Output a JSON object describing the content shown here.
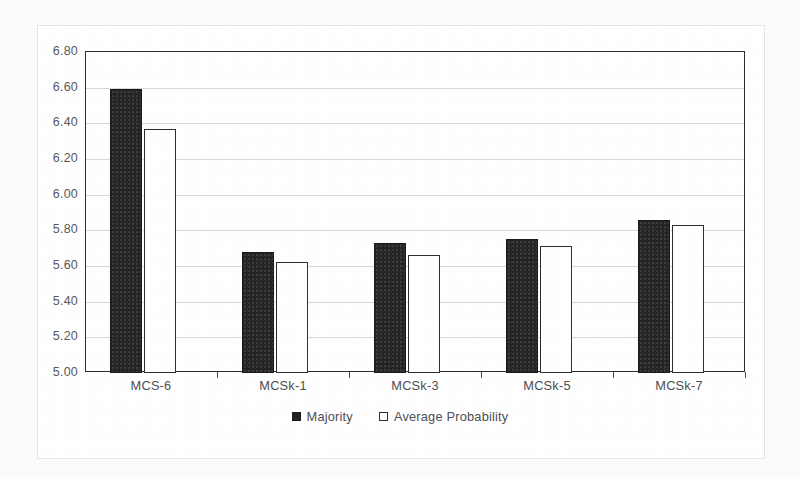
{
  "chart_data": {
    "type": "bar",
    "title": "",
    "subtitle": "",
    "xlabel": "",
    "ylabel": "",
    "categories": [
      "MCS-6",
      "MCSk-1",
      "MCSk-3",
      "MCSk-5",
      "MCSk-7"
    ],
    "series": [
      {
        "name": "Majority",
        "color": "#232323",
        "style": "filled",
        "values": [
          6.59,
          5.68,
          5.73,
          5.75,
          5.86
        ]
      },
      {
        "name": "Average Probability",
        "color": "#ffffff",
        "style": "outlined",
        "values": [
          6.37,
          5.62,
          5.66,
          5.71,
          5.83
        ]
      }
    ],
    "ylim": [
      5.0,
      6.8
    ],
    "ytick_step": 0.2,
    "ytick_labels": [
      "6.80",
      "6.60",
      "6.40",
      "6.20",
      "6.00",
      "5.80",
      "5.60",
      "5.40",
      "5.20",
      "5.00"
    ],
    "ytick_values": [
      6.8,
      6.6,
      6.4,
      6.2,
      6.0,
      5.8,
      5.6,
      5.4,
      5.2,
      5.0
    ],
    "grid": true,
    "grid_axis": "y",
    "legend_position": "bottom",
    "legend_entries": [
      "Majority",
      "Average Probability"
    ],
    "annotations": []
  },
  "colors": {
    "majority": "#232323",
    "average_probability": "#ffffff",
    "outline": "#2e2e2e",
    "gridline": "#d8d8dc",
    "frame": "#2b2b2b",
    "text": "#4e4e54",
    "page_background": "#fbfbfb",
    "plot_background": "#ffffff"
  }
}
